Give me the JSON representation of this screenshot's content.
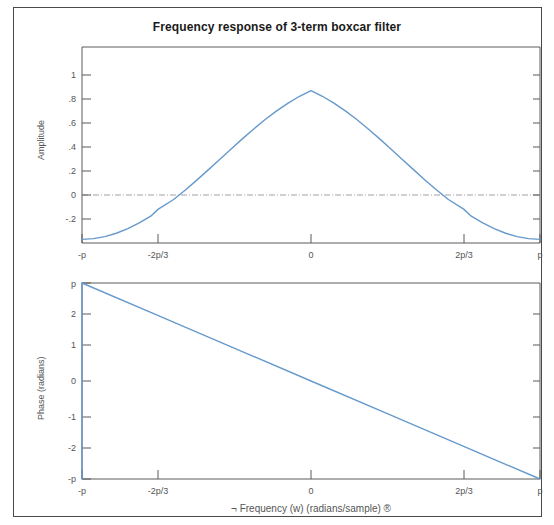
{
  "figure": {
    "title": "Frequency response of 3-term boxcar filter",
    "border_color": "#4a4a4a",
    "background": "#ffffff"
  },
  "chart_data": [
    {
      "type": "line",
      "id": "amplitude-response",
      "title": "Frequency response of 3-term boxcar filter",
      "xlabel": "",
      "ylabel": "Amplitude",
      "xlim": [
        -3.14159,
        3.14159
      ],
      "ylim": [
        -0.36,
        1.08
      ],
      "grid": false,
      "legend": null,
      "line_color": "#6699cc",
      "x_tick_labels": [
        "-p",
        "-2p/3",
        "0",
        "2p/3",
        "p"
      ],
      "x_tick_values": [
        -3.14159,
        -2.0944,
        0,
        2.0944,
        3.14159
      ],
      "y_tick_labels": [
        "1",
        ".8",
        ".6",
        ".4",
        ".2",
        "0",
        "-.2"
      ],
      "y_tick_values": [
        1,
        0.8,
        0.6,
        0.4,
        0.2,
        0,
        -0.2
      ],
      "reference_line": {
        "y": 0,
        "style": "dash-dot",
        "color": "#8a8a8a"
      },
      "x": [
        -3.14159,
        -2.98451,
        -2.82743,
        -2.67035,
        -2.51327,
        -2.35619,
        -2.19911,
        -2.0944,
        -1.88496,
        -1.72788,
        -1.5708,
        -1.41372,
        -1.25664,
        -1.09956,
        -0.94248,
        -0.7854,
        -0.62832,
        -0.47124,
        -0.31416,
        -0.15708,
        0,
        0.15708,
        0.31416,
        0.47124,
        0.62832,
        0.7854,
        0.94248,
        1.09956,
        1.25664,
        1.41372,
        1.5708,
        1.72788,
        1.88496,
        2.0944,
        2.19911,
        2.35619,
        2.51327,
        2.67035,
        2.82743,
        2.98451,
        3.14159
      ],
      "y": [
        -0.3333,
        -0.3282,
        -0.313,
        -0.2882,
        -0.2543,
        -0.2122,
        -0.1628,
        -0.1111,
        -0.0405,
        0.0275,
        0.0999,
        0.1753,
        0.2522,
        0.3293,
        0.405,
        0.478,
        0.5469,
        0.6107,
        0.668,
        0.718,
        0.7598,
        0.718,
        0.668,
        0.6107,
        0.5469,
        0.478,
        0.405,
        0.3293,
        0.2522,
        0.1753,
        0.0999,
        0.0275,
        -0.0405,
        -0.1111,
        -0.1628,
        -0.2122,
        -0.2543,
        -0.2882,
        -0.313,
        -0.3282,
        -0.3333
      ],
      "formula_note": "A(w) = (1 + 2*cos(w))/3, peak value 1 at w=0, value -1/3 at w=+/-p"
    },
    {
      "type": "line",
      "id": "phase-response",
      "title": "",
      "xlabel": "¬ Frequency (w) (radians/sample) ®",
      "ylabel": "Phase (radians)",
      "xlim": [
        -3.14159,
        3.14159
      ],
      "ylim": [
        -3.14159,
        3.14159
      ],
      "grid": false,
      "legend": null,
      "line_color": "#6699cc",
      "x_tick_labels": [
        "-p",
        "-2p/3",
        "0",
        "2p/3",
        "p"
      ],
      "x_tick_values": [
        -3.14159,
        -2.0944,
        0,
        2.0944,
        3.14159
      ],
      "y_tick_labels": [
        "p",
        "2",
        "1",
        "0",
        "-1",
        "-2",
        "-p"
      ],
      "y_tick_values": [
        3.14159,
        2,
        1,
        0,
        -1,
        -2,
        -3.14159
      ],
      "x": [
        -3.14159,
        -2.0944,
        -1.0472,
        0,
        1.0472,
        2.0944,
        3.14159
      ],
      "y": [
        3.14159,
        2.0944,
        1.0472,
        0,
        -1.0472,
        -2.0944,
        -3.14159
      ],
      "formula_note": "Phase decreases linearly from +p at w=-p to -p at w=+p"
    }
  ]
}
